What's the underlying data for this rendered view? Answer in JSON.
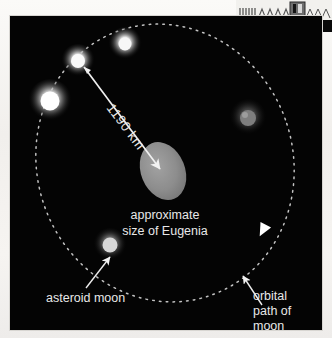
{
  "figure": {
    "background_color": "#040404",
    "page_color": "#f3f2ef",
    "labels": {
      "distance": "1190 km",
      "center_line1": "approximate",
      "center_line2": "size of Eugenia",
      "moon_label": "asteroid moon",
      "orbit_line1": "orbital",
      "orbit_line2": "path of",
      "orbit_line3": "moon"
    },
    "colors": {
      "asteroid_fill": "#8f8f8f",
      "orbit_dotted": "#b9b9b9",
      "moon_glow": "#ffffff",
      "text": "#e8e8e8",
      "arrow": "#f2f2f2"
    },
    "orbit": {
      "center_x": 155,
      "center_y": 147,
      "radius_x": 128,
      "radius_y": 140,
      "rotation_deg": -18,
      "style": "dotted"
    },
    "asteroid": {
      "center_x": 153,
      "center_y": 155,
      "radius_x": 22,
      "radius_y": 30,
      "rotation_deg": -22
    },
    "moons": [
      {
        "name": "moon-top",
        "x": 115,
        "y": 28,
        "r": 10,
        "brightness": 0.95
      },
      {
        "name": "moon-upper-left",
        "x": 68,
        "y": 45,
        "r": 10,
        "brightness": 1.0
      },
      {
        "name": "moon-left",
        "x": 40,
        "y": 85,
        "r": 13,
        "brightness": 1.0
      },
      {
        "name": "moon-right",
        "x": 238,
        "y": 102,
        "r": 11,
        "brightness": 0.55
      },
      {
        "name": "moon-bottom-left",
        "x": 100,
        "y": 229,
        "r": 10,
        "brightness": 0.8
      }
    ],
    "direction_marker": {
      "name": "orbit-direction-arrow",
      "x": 253,
      "y": 214,
      "rotation_deg": 118
    },
    "distance_arrow": {
      "from_x": 74,
      "from_y": 51,
      "to_x": 149,
      "to_y": 152,
      "text_rotation_deg": 53
    },
    "moon_callout_arrow": {
      "from_x": 76,
      "from_y": 272,
      "to_x": 99,
      "to_y": 242
    },
    "orbit_callout_arrow": {
      "from_x": 252,
      "from_y": 288,
      "to_x": 232,
      "to_y": 259
    }
  },
  "scan_artifact": {
    "name": "facing-page-bleed",
    "description": "partial printed graphic bleeding in from the adjacent page"
  }
}
